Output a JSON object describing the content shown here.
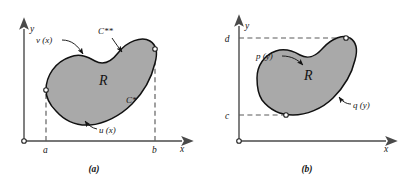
{
  "figure": {
    "background_color": "#ffffff",
    "ink_color": "#141414",
    "region_fill_color": "#a9a9a9",
    "region_stroke_color": "#111111",
    "axis_color": "#4a4a4a",
    "dash_color": "#5a5a5a"
  },
  "panel_a": {
    "caption": "(a)",
    "region_label": "R",
    "axis": {
      "x_label": "x",
      "y_label": "y",
      "origin_marker": "open-circle"
    },
    "ticks": [
      {
        "label": "a",
        "axis": "x"
      },
      {
        "label": "b",
        "axis": "x"
      }
    ],
    "annotations": [
      {
        "name": "upper-left-boundary",
        "label": "v (x)"
      },
      {
        "name": "upper-curve",
        "label": "C**"
      },
      {
        "name": "lower-right-curve",
        "label": "C*"
      },
      {
        "name": "lower-boundary",
        "label": "u (x)"
      }
    ]
  },
  "panel_b": {
    "caption": "(b)",
    "region_label": "R",
    "axis": {
      "x_label": "x",
      "y_label": "y",
      "origin_marker": "open-circle"
    },
    "ticks": [
      {
        "label": "d",
        "axis": "y"
      },
      {
        "label": "c",
        "axis": "y"
      }
    ],
    "annotations": [
      {
        "name": "upper-left-boundary",
        "label": "p (y)"
      },
      {
        "name": "lower-right-curve",
        "label": "q (y)"
      }
    ]
  }
}
